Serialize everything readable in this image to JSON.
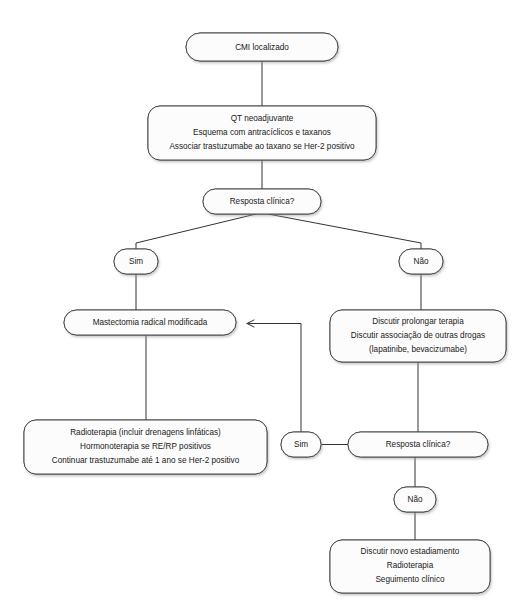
{
  "diagram": {
    "background_color": "#ffffff",
    "node_fill": "#fcfcfc",
    "node_stroke": "#4a4a4a",
    "edge_color": "#333333",
    "text_color": "#202020"
  },
  "nodes": {
    "start": {
      "name": "cmi-localizado",
      "lines": [
        "CMI localizado"
      ],
      "shape": "rounded-rect",
      "x": 186,
      "y": 33,
      "w": 152,
      "h": 28
    },
    "qt": {
      "name": "qt-neoadjuvante",
      "lines": [
        "QT neoadjuvante",
        "Esquema com antracíclicos e taxanos",
        "Associar trastuzumabe ao taxano se Her-2 positivo"
      ],
      "shape": "rounded-rect",
      "x": 148,
      "y": 106,
      "w": 228,
      "h": 54
    },
    "resp1": {
      "name": "resposta-clinica-1",
      "lines": [
        "Resposta clínica?"
      ],
      "shape": "rounded-rect",
      "x": 203,
      "y": 189,
      "w": 118,
      "h": 25
    },
    "sim1": {
      "name": "sim-1",
      "lines": [
        "Sim"
      ],
      "shape": "pill",
      "x": 114,
      "y": 249,
      "w": 44,
      "h": 25
    },
    "nao1": {
      "name": "nao-1",
      "lines": [
        "Não"
      ],
      "shape": "pill",
      "x": 399,
      "y": 249,
      "w": 44,
      "h": 25
    },
    "mastectomia": {
      "name": "mastectomia-radical-modificada",
      "lines": [
        "Mastectomia radical modificada"
      ],
      "shape": "rounded-rect",
      "x": 64,
      "y": 310,
      "w": 172,
      "h": 25
    },
    "discutir": {
      "name": "discutir-prolongar-terapia",
      "lines": [
        "Discutir prolongar terapia",
        "Discutir associação de outras drogas",
        "(lapatinibe, bevacizumabe)"
      ],
      "shape": "rounded-rect",
      "x": 330,
      "y": 310,
      "w": 176,
      "h": 52
    },
    "radioterapia": {
      "name": "radioterapia-hormonoterapia",
      "lines": [
        "Radioterapia (incluir drenagens linfáticas)",
        "Hormonoterapia se RE/RP positivos",
        "Continuar trastuzumabe até 1 ano se Her-2 positivo"
      ],
      "shape": "rounded-rect",
      "x": 24,
      "y": 420,
      "w": 243,
      "h": 54
    },
    "sim2": {
      "name": "sim-2",
      "lines": [
        "Sim"
      ],
      "shape": "pill",
      "x": 281,
      "y": 432,
      "w": 40,
      "h": 25
    },
    "resp2": {
      "name": "resposta-clinica-2",
      "lines": [
        "Resposta clínica?"
      ],
      "shape": "rounded-rect",
      "x": 348,
      "y": 432,
      "w": 140,
      "h": 25
    },
    "nao2": {
      "name": "nao-2",
      "lines": [
        "Não"
      ],
      "shape": "pill",
      "x": 394,
      "y": 487,
      "w": 42,
      "h": 25
    },
    "final": {
      "name": "discutir-novo-estadiamento",
      "lines": [
        "Discutir novo estadiamento",
        "Radioterapia",
        "Seguimento clínico"
      ],
      "shape": "rounded-rect",
      "x": 330,
      "y": 540,
      "w": 160,
      "h": 53
    }
  },
  "edges": [
    {
      "name": "edge-start-to-qt",
      "from": "start",
      "to": "qt",
      "path": "M262,61 L262,106"
    },
    {
      "name": "edge-qt-to-resp1",
      "from": "qt",
      "to": "resp1",
      "path": "M262,160 L262,189"
    },
    {
      "name": "edge-resp1-to-sim1",
      "from": "resp1",
      "to": "sim1",
      "label": "Sim",
      "path": "M262,214 L136,243 L136,249"
    },
    {
      "name": "edge-resp1-to-nao1",
      "from": "resp1",
      "to": "nao1",
      "label": "Não",
      "path": "M262,214 L421,243 L421,249"
    },
    {
      "name": "edge-sim1-to-mastectomia",
      "from": "sim1",
      "to": "mastectomia",
      "path": "M136,274 L136,310"
    },
    {
      "name": "edge-nao1-to-discutir",
      "from": "nao1",
      "to": "discutir",
      "path": "M421,274 L421,310"
    },
    {
      "name": "edge-mastectomia-to-radioterapia",
      "from": "mastectomia",
      "to": "radioterapia",
      "path": "M146,335 L146,420"
    },
    {
      "name": "edge-discutir-to-resp2",
      "from": "discutir",
      "to": "resp2",
      "path": "M418,362 L418,432"
    },
    {
      "name": "edge-resp2-to-sim2",
      "from": "resp2",
      "to": "sim2",
      "label": "Sim",
      "path": "M348,444 L321,444"
    },
    {
      "name": "edge-sim2-to-mastectomia",
      "from": "sim2",
      "to": "mastectomia",
      "arrow": true,
      "path": "M301,432 L301,324 L246,324"
    },
    {
      "name": "edge-resp2-to-nao2",
      "from": "resp2",
      "to": "nao2",
      "label": "Não",
      "path": "M415,457 L415,487"
    },
    {
      "name": "edge-nao2-to-final",
      "from": "nao2",
      "to": "final",
      "path": "M415,512 L415,540"
    }
  ]
}
